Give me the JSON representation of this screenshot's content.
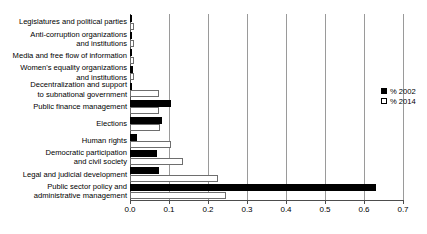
{
  "chart_data": {
    "type": "bar",
    "orientation": "horizontal",
    "title": "",
    "xlabel": "",
    "ylabel": "",
    "xlim": [
      0.0,
      0.7
    ],
    "xticks": [
      "0.0",
      "0.1",
      "0.2",
      "0.3",
      "0.4",
      "0.5",
      "0.6",
      "0.7"
    ],
    "xtick_values": [
      0.0,
      0.1,
      0.2,
      0.3,
      0.4,
      0.5,
      0.6,
      0.7
    ],
    "grid": true,
    "legend_position": "right",
    "categories": [
      "Legislatures and political parties",
      "Anti-corruption organizations and institutions",
      "Media and free flow of information",
      "Women's equality organizations and institutions",
      "Decentralization and support to subnational government",
      "Public finance management",
      "Elections",
      "Human rights",
      "Democratic participation and civil society",
      "Legal and judicial development",
      "Public sector policy and administrative management"
    ],
    "series": [
      {
        "name": "% 2002",
        "color": "#000000",
        "values": [
          0.002,
          0.002,
          0.002,
          0.008,
          0.004,
          0.105,
          0.083,
          0.018,
          0.068,
          0.075,
          0.63
        ]
      },
      {
        "name": "% 2014",
        "color": "#ffffff",
        "values": [
          0.007,
          0.007,
          0.006,
          0.009,
          0.075,
          0.075,
          0.078,
          0.105,
          0.135,
          0.225,
          0.245
        ]
      }
    ]
  },
  "legend": {
    "entries": [
      {
        "label": "% 2002",
        "swatch": "filled-square"
      },
      {
        "label": "% 2014",
        "swatch": "hollow-square"
      }
    ]
  },
  "category_labels": [
    {
      "lines": [
        "Legislatures and political parties"
      ]
    },
    {
      "lines": [
        "Anti-corruption organizations",
        "and institutions"
      ]
    },
    {
      "lines": [
        "Media and free flow of information"
      ]
    },
    {
      "lines": [
        "Women's equality organizations",
        "and institutions"
      ]
    },
    {
      "lines": [
        "Decentralization and support",
        "to subnational government"
      ]
    },
    {
      "lines": [
        "Public finance management"
      ]
    },
    {
      "lines": [
        "Elections"
      ]
    },
    {
      "lines": [
        "Human rights"
      ]
    },
    {
      "lines": [
        "Democratic participation",
        "and civil society"
      ]
    },
    {
      "lines": [
        "Legal and judicial development"
      ]
    },
    {
      "lines": [
        "Public sector policy and",
        "administrative management"
      ]
    }
  ]
}
